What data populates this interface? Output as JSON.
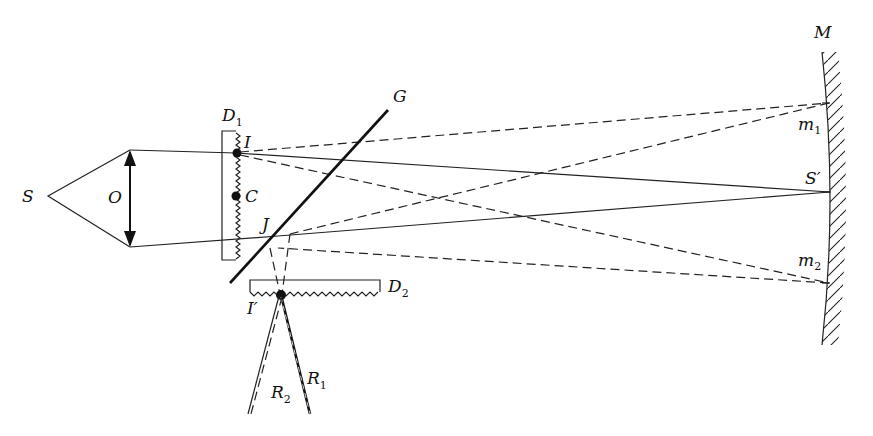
{
  "figure": {
    "type": "optical-diagram"
  },
  "labels": {
    "source": "S",
    "lens": "O",
    "grating1": {
      "main": "D",
      "sub": "1"
    },
    "point_I": "I",
    "point_C": "C",
    "point_J": "J",
    "plate": "G",
    "grating2": {
      "main": "D",
      "sub": "2"
    },
    "point_I_prime": "I′",
    "ray1": {
      "main": "R",
      "sub": "1"
    },
    "ray2": {
      "main": "R",
      "sub": "2"
    },
    "mirror": "M",
    "mirror_point1": {
      "main": "m",
      "sub": "1"
    },
    "mirror_point2": {
      "main": "m",
      "sub": "2"
    },
    "image_point": "S′"
  }
}
